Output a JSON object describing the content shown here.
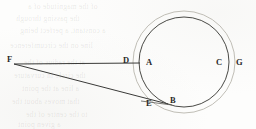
{
  "figure": {
    "caption": "",
    "background_color": "#fdfdfc",
    "ink_color": "#3a3a38",
    "outer_circle_color": "#b9b7ae",
    "inner_circle_color": "#4a4a46",
    "labels": [
      {
        "id": "A",
        "text": "A",
        "x": 146,
        "y": 58
      },
      {
        "id": "B",
        "text": "B",
        "x": 170,
        "y": 96
      },
      {
        "id": "C",
        "text": "C",
        "x": 216,
        "y": 58
      },
      {
        "id": "D",
        "text": "D",
        "x": 123,
        "y": 56
      },
      {
        "id": "E",
        "text": "E",
        "x": 146,
        "y": 99
      },
      {
        "id": "F",
        "text": "F",
        "x": 7,
        "y": 55
      },
      {
        "id": "G",
        "text": "G",
        "x": 236,
        "y": 58
      }
    ],
    "geometry": {
      "inner_circle": {
        "cx": 184,
        "cy": 62,
        "r": 45
      },
      "outer_circle": {
        "cx": 184,
        "cy": 62,
        "r": 51
      },
      "apex_point": {
        "x": 14,
        "y": 64
      },
      "horizontal_line_end": {
        "x": 140,
        "y": 63
      },
      "tangent_line_end": {
        "x": 168,
        "y": 104
      },
      "tangent_extension_end": {
        "x": 145,
        "y": 102
      }
    },
    "ghost_text": [
      {
        "text": "of the magnitude of a",
        "x": 28,
        "y": 2
      },
      {
        "text": "the passing through",
        "x": 16,
        "y": 14
      },
      {
        "text": "a constant, a perfect being",
        "x": 20,
        "y": 26
      },
      {
        "text": "line on the circumference",
        "x": 10,
        "y": 41
      },
      {
        "text": "at the radius of the",
        "x": 24,
        "y": 58
      },
      {
        "text": "the circle in curvature",
        "x": 14,
        "y": 71
      },
      {
        "text": "a line at the point",
        "x": 22,
        "y": 84
      },
      {
        "text": "that moves about the",
        "x": 12,
        "y": 97
      },
      {
        "text": "to the centre of the",
        "x": 26,
        "y": 110
      },
      {
        "text": "a given point",
        "x": 18,
        "y": 120
      }
    ]
  }
}
